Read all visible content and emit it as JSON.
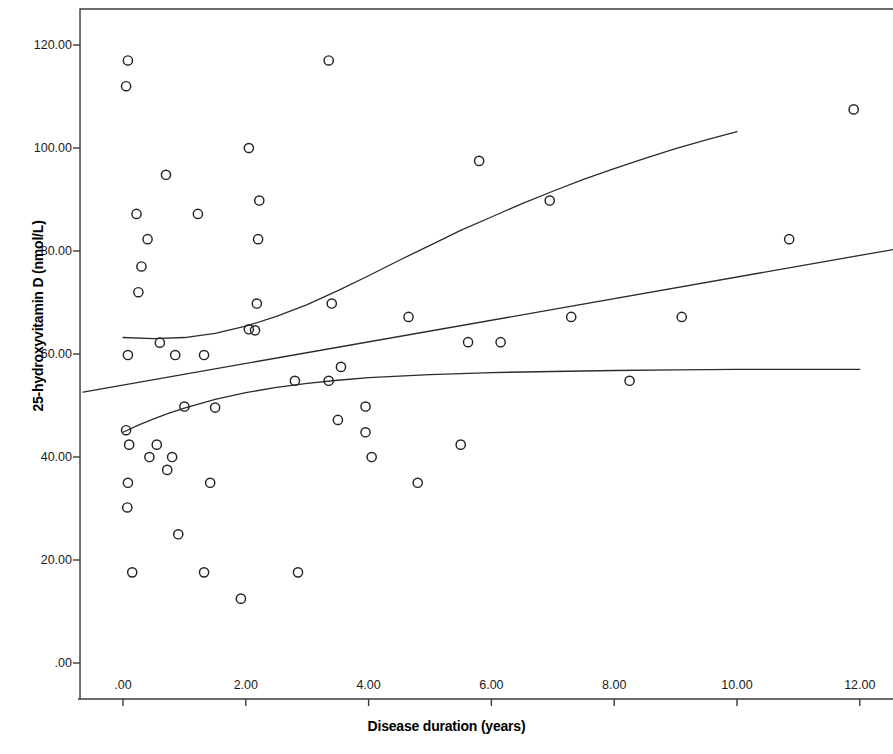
{
  "chart_data": {
    "type": "scatter",
    "title": "",
    "xlabel": "Disease duration (years)",
    "ylabel": "25-hydroxyvitamin D (nmol/L)",
    "xlim": [
      -0.7,
      12.55
    ],
    "ylim": [
      -7.0,
      127.0
    ],
    "xticks": [
      0,
      2,
      4,
      6,
      8,
      10,
      12
    ],
    "xticklabels": [
      ".00",
      "2.00",
      "4.00",
      "6.00",
      "8.00",
      "10.00",
      "12.00"
    ],
    "yticks": [
      0,
      20,
      40,
      60,
      80,
      100,
      120
    ],
    "yticklabels": [
      ".00",
      "20.00",
      "40.00",
      "60.00",
      "80.00",
      "100.00",
      "120.00"
    ],
    "grid": false,
    "legend": null,
    "marker": "open-circle",
    "marker_color": "#222222",
    "points": [
      [
        0.08,
        117.0
      ],
      [
        0.05,
        112.0
      ],
      [
        0.7,
        94.8
      ],
      [
        0.22,
        87.2
      ],
      [
        1.22,
        87.2
      ],
      [
        0.4,
        82.3
      ],
      [
        0.3,
        77.0
      ],
      [
        0.25,
        72.0
      ],
      [
        0.08,
        59.8
      ],
      [
        0.6,
        62.2
      ],
      [
        0.85,
        59.8
      ],
      [
        1.32,
        59.8
      ],
      [
        0.05,
        45.2
      ],
      [
        0.1,
        42.4
      ],
      [
        0.55,
        42.4
      ],
      [
        0.43,
        40.0
      ],
      [
        0.8,
        40.0
      ],
      [
        0.72,
        37.5
      ],
      [
        0.08,
        35.0
      ],
      [
        0.07,
        30.2
      ],
      [
        0.9,
        25.0
      ],
      [
        0.15,
        17.6
      ],
      [
        1.32,
        17.6
      ],
      [
        1.0,
        49.8
      ],
      [
        1.5,
        49.6
      ],
      [
        1.42,
        35.0
      ],
      [
        1.92,
        12.5
      ],
      [
        2.05,
        100.0
      ],
      [
        2.22,
        89.8
      ],
      [
        2.2,
        82.3
      ],
      [
        2.18,
        69.8
      ],
      [
        2.05,
        64.8
      ],
      [
        2.15,
        64.6
      ],
      [
        2.8,
        54.8
      ],
      [
        2.85,
        17.6
      ],
      [
        3.35,
        117.0
      ],
      [
        3.35,
        54.8
      ],
      [
        3.4,
        69.8
      ],
      [
        3.55,
        57.5
      ],
      [
        3.5,
        47.2
      ],
      [
        3.95,
        49.8
      ],
      [
        3.95,
        44.8
      ],
      [
        4.05,
        40.0
      ],
      [
        4.65,
        67.2
      ],
      [
        4.8,
        35.0
      ],
      [
        5.5,
        42.4
      ],
      [
        5.62,
        62.3
      ],
      [
        5.8,
        97.5
      ],
      [
        6.15,
        62.3
      ],
      [
        6.95,
        89.8
      ],
      [
        7.3,
        67.2
      ],
      [
        8.25,
        54.8
      ],
      [
        9.1,
        67.2
      ],
      [
        10.85,
        82.3
      ],
      [
        11.9,
        107.5
      ]
    ],
    "fit_lines": [
      {
        "name": "quadratic-upper-fit",
        "style": "solid",
        "points": [
          [
            0.0,
            63.2
          ],
          [
            0.5,
            63.0
          ],
          [
            1.0,
            63.2
          ],
          [
            1.5,
            64.0
          ],
          [
            2.0,
            65.4
          ],
          [
            2.5,
            67.3
          ],
          [
            3.0,
            69.6
          ],
          [
            3.5,
            72.3
          ],
          [
            4.0,
            75.2
          ],
          [
            4.5,
            78.2
          ],
          [
            5.0,
            81.1
          ],
          [
            5.5,
            84.0
          ],
          [
            6.0,
            86.6
          ],
          [
            6.5,
            89.2
          ],
          [
            7.0,
            91.6
          ],
          [
            7.5,
            93.9
          ],
          [
            8.0,
            96.0
          ],
          [
            8.5,
            98.0
          ],
          [
            9.0,
            99.9
          ],
          [
            9.5,
            101.6
          ],
          [
            10.0,
            103.2
          ]
        ]
      },
      {
        "name": "linear-fit",
        "style": "solid",
        "points": [
          [
            -0.65,
            52.6
          ],
          [
            12.55,
            80.3
          ]
        ]
      },
      {
        "name": "flattening-lower-fit",
        "style": "solid",
        "points": [
          [
            0.0,
            44.8
          ],
          [
            0.25,
            46.2
          ],
          [
            0.5,
            47.4
          ],
          [
            0.75,
            48.5
          ],
          [
            1.0,
            49.5
          ],
          [
            1.5,
            51.2
          ],
          [
            2.0,
            52.5
          ],
          [
            2.5,
            53.5
          ],
          [
            3.0,
            54.3
          ],
          [
            3.5,
            54.9
          ],
          [
            4.0,
            55.4
          ],
          [
            5.0,
            56.0
          ],
          [
            6.0,
            56.4
          ],
          [
            7.0,
            56.6
          ],
          [
            8.0,
            56.8
          ],
          [
            9.0,
            56.9
          ],
          [
            10.0,
            57.0
          ],
          [
            11.0,
            57.0
          ],
          [
            12.0,
            57.0
          ]
        ]
      }
    ],
    "axis_color": "#3a3a3a",
    "line_color": "#2b2b2b"
  }
}
